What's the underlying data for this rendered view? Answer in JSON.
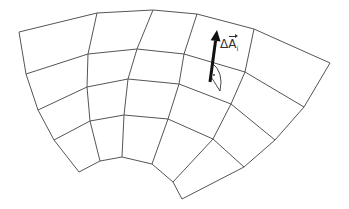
{
  "figure": {
    "type": "curvilinear surface grid with area element normal vector",
    "label": {
      "delta": "Δ",
      "symbol": "A",
      "subscript": "i"
    },
    "colors": {
      "grid": "#555555",
      "arrow": "#111111",
      "background": "#ffffff"
    },
    "grid": {
      "columns": 6,
      "rows": 5,
      "vertices": [
        [
          [
            19,
            32
          ],
          [
            97,
            13
          ],
          [
            153,
            10
          ],
          [
            197,
            14
          ],
          [
            254,
            29
          ],
          [
            330,
            63
          ]
        ],
        [
          [
            26,
            74
          ],
          [
            88,
            54
          ],
          [
            137,
            49
          ],
          [
            184,
            54
          ],
          [
            245,
            72
          ],
          [
            304,
            107
          ]
        ],
        [
          [
            38,
            110
          ],
          [
            87,
            87
          ],
          [
            128,
            79
          ],
          [
            179,
            84
          ],
          [
            231,
            104
          ],
          [
            275,
            140
          ]
        ],
        [
          [
            54,
            140
          ],
          [
            90,
            121
          ],
          [
            124,
            115
          ],
          [
            168,
            119
          ],
          [
            213,
            139
          ],
          [
            244,
            167
          ]
        ],
        [
          [
            79,
            172
          ],
          [
            100,
            161
          ],
          [
            122,
            157
          ],
          [
            152,
            164
          ],
          [
            173,
            182
          ],
          [
            182,
            199
          ]
        ]
      ]
    },
    "arrow": {
      "from": [
        210,
        82
      ],
      "to": [
        217,
        30
      ],
      "name": "normal-vector-arrow"
    },
    "area_element": {
      "path": "M212,63 Q224,72 220,91 Q213,80 210,75"
    }
  }
}
